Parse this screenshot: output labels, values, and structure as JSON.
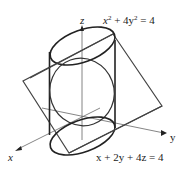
{
  "figure": {
    "axes": {
      "z_label": "z",
      "y_label": "y",
      "x_label": "x"
    },
    "labels": {
      "cylinder_equation": "x² + 4y² = 4",
      "cylinder_base": "x",
      "cylinder_sup1": "2",
      "cylinder_mid": " + 4y",
      "cylinder_sup2": "2",
      "cylinder_end": " = 4",
      "plane_equation": "x + 2y + 4z = 4"
    },
    "colors": {
      "stroke": "#222222",
      "axis": "#555555",
      "background": "#ffffff"
    }
  }
}
